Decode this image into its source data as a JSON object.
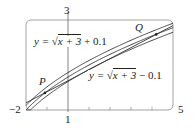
{
  "chart_data": {
    "type": "line",
    "title": "",
    "xlabel": "",
    "ylabel": "",
    "xlim": [
      -2,
      5
    ],
    "ylim": [
      1,
      3
    ],
    "tick_labels": {
      "x_min": "−2",
      "x_max": "5",
      "y_min": "1",
      "y_max": "3"
    },
    "grid": false,
    "series": [
      {
        "name": "y = √(x+3) + 0.1",
        "function": "sqrt(x+3)+0.1"
      },
      {
        "name": "y = √(x+3)",
        "function": "sqrt(x+3)"
      },
      {
        "name": "y = √(x+3) − 0.1",
        "function": "sqrt(x+3)-0.1"
      },
      {
        "name": "secant line PQ",
        "function": "line through P and Q"
      }
    ],
    "points": [
      {
        "label": "P",
        "x": -1.1,
        "y": 1.38
      },
      {
        "label": "Q",
        "x": 4.2,
        "y": 2.68
      }
    ],
    "annotations": [
      {
        "text": "y = √x + 3 + 0.1",
        "position": "upper-left"
      },
      {
        "text": "y = √x + 3 − 0.1",
        "position": "center-right"
      },
      {
        "text": "P"
      },
      {
        "text": "Q"
      }
    ]
  },
  "labels": {
    "x_min": "−2",
    "x_max": "5",
    "y_top": "3",
    "y_bottom": "1",
    "upper_eq_prefix": "y = ",
    "upper_eq_rad": "x + 3",
    "upper_eq_suffix": " + 0.1",
    "lower_eq_prefix": "y = ",
    "lower_eq_rad": "x + 3",
    "lower_eq_suffix": " − 0.1",
    "point_p": "P",
    "point_q": "Q"
  }
}
